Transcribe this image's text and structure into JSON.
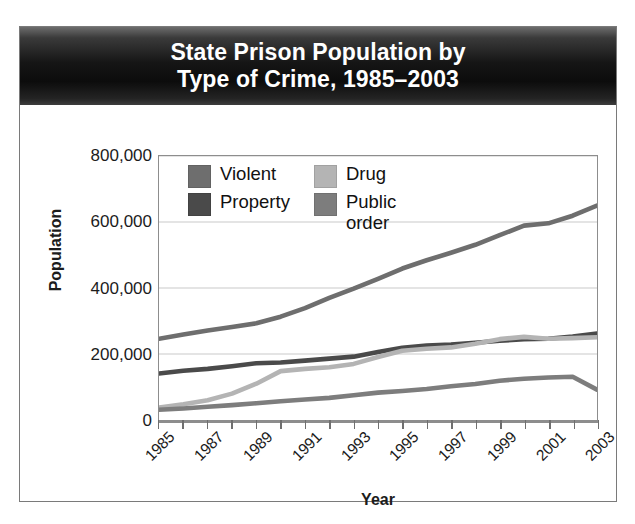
{
  "title": {
    "line1": "State Prison Population by",
    "line2": "Type of Crime, 1985–2003"
  },
  "axes": {
    "y_label": "Population",
    "x_label": "Year",
    "y_ticks": [
      "0",
      "200,000",
      "400,000",
      "600,000",
      "800,000"
    ]
  },
  "legend": [
    {
      "label": "Violent",
      "color": "#6e6e6e"
    },
    {
      "label": "Drug",
      "color": "#b4b4b4"
    },
    {
      "label": "Property",
      "color": "#4a4a4a"
    },
    {
      "label": "Public order",
      "color": "#7d7d7d"
    }
  ],
  "colors": {
    "banner_dark": "#0c0c0c",
    "frame": "#8d8d8d",
    "gridline": "#c9c9c9",
    "text": "#1c1c1c",
    "card_border": "#7a7a7a"
  },
  "chart_data": {
    "type": "line",
    "title": "State Prison Population by Type of Crime, 1985–2003",
    "xlabel": "Year",
    "ylabel": "Population",
    "xlim": [
      1985,
      2003
    ],
    "ylim": [
      0,
      800000
    ],
    "ytick_values": [
      0,
      200000,
      400000,
      600000,
      800000
    ],
    "xtick_labels": [
      "1985",
      "1987",
      "1989",
      "1991",
      "1993",
      "1995",
      "1997",
      "1999",
      "2001",
      "2003"
    ],
    "xtick_all_years": [
      1985,
      1986,
      1987,
      1988,
      1989,
      1990,
      1991,
      1992,
      1993,
      1994,
      1995,
      1996,
      1997,
      1998,
      1999,
      2000,
      2001,
      2002,
      2003
    ],
    "grid": "horizontal",
    "legend_position": "upper-left-inside",
    "x": [
      1985,
      1986,
      1987,
      1988,
      1989,
      1990,
      1991,
      1992,
      1993,
      1994,
      1995,
      1996,
      1997,
      1998,
      1999,
      2000,
      2001,
      2002,
      2003
    ],
    "series": [
      {
        "name": "Violent",
        "color": "#6e6e6e",
        "values": [
          246000,
          259000,
          271000,
          282000,
          293000,
          313000,
          339000,
          370000,
          398000,
          428000,
          459000,
          484000,
          507000,
          531000,
          560000,
          589000,
          596000,
          619000,
          650000
        ]
      },
      {
        "name": "Property",
        "color": "#4a4a4a",
        "values": [
          141000,
          149000,
          155000,
          163000,
          172000,
          174000,
          180000,
          186000,
          192000,
          206000,
          219000,
          226000,
          229000,
          234000,
          240000,
          245000,
          246000,
          253000,
          262000
        ]
      },
      {
        "name": "Drug",
        "color": "#b4b4b4",
        "values": [
          38000,
          48000,
          60000,
          80000,
          110000,
          148000,
          155000,
          160000,
          170000,
          191000,
          210000,
          216000,
          220000,
          231000,
          245000,
          252000,
          246000,
          248000,
          251000
        ]
      },
      {
        "name": "Public order",
        "color": "#7d7d7d",
        "values": [
          31000,
          35000,
          40000,
          45000,
          51000,
          57000,
          62000,
          67000,
          75000,
          83000,
          88000,
          94000,
          102000,
          109000,
          119000,
          125000,
          129000,
          131000,
          92000
        ]
      }
    ]
  }
}
